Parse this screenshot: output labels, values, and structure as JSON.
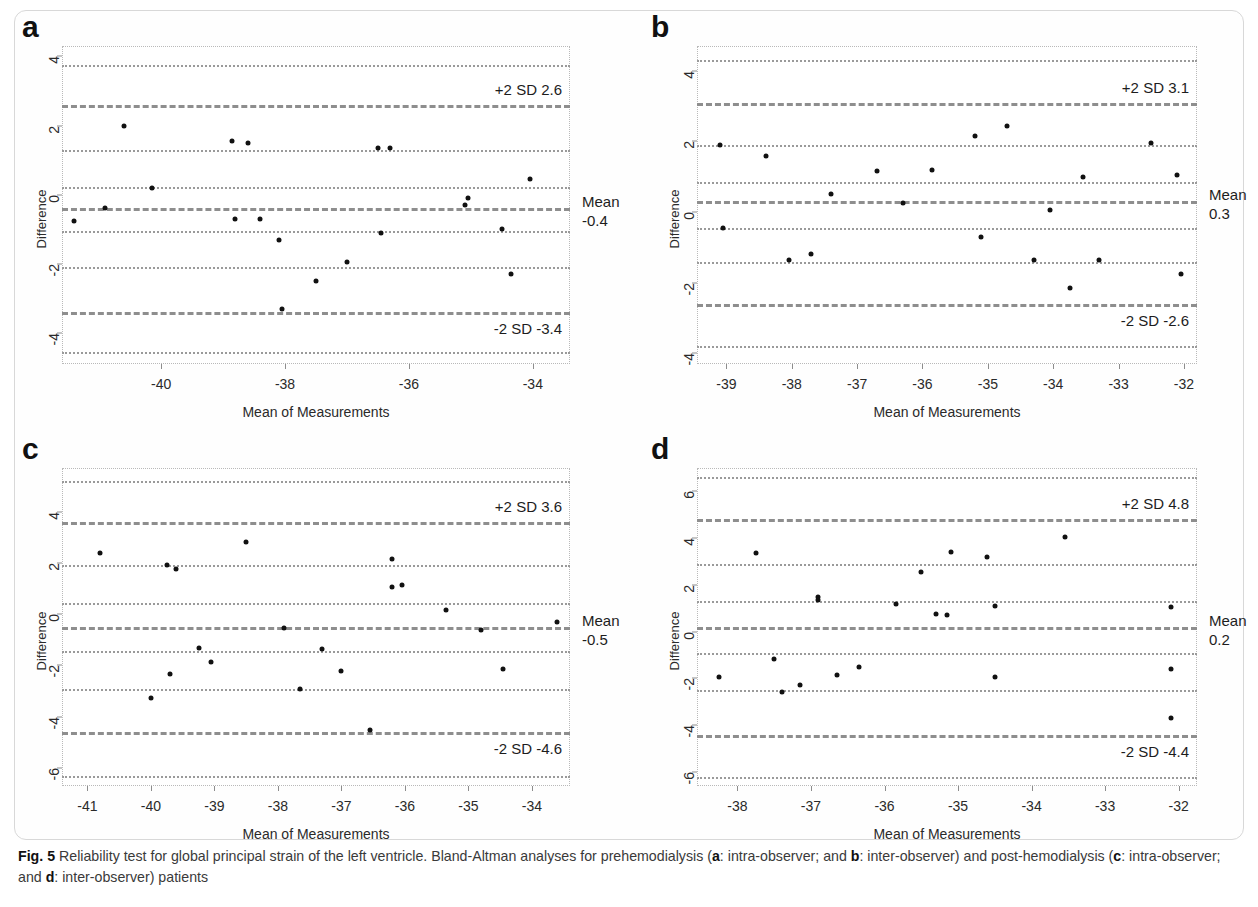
{
  "figure": {
    "label": "Fig. 5",
    "caption_part1": "Reliability test for global principal strain of the left ventricle. Bland-Altman analyses for prehemodialysis (",
    "caption_a": "a",
    "caption_part2": ": intra-observer; and ",
    "caption_b": "b",
    "caption_part3": ": inter-observer) and post-hemodialysis (",
    "caption_c": "c",
    "caption_part4": ": intra-observer; and ",
    "caption_d": "d",
    "caption_part5": ": inter-observer) patients"
  },
  "panels": {
    "a": {
      "letter": "a",
      "xlabel": "Mean of Measurements",
      "ylabel": "Difference",
      "upper_annotation": "+2 SD 2.6",
      "lower_annotation": "-2 SD -3.4",
      "mean_label_line1": "Mean",
      "mean_label_line2": "-0.4"
    },
    "b": {
      "letter": "b",
      "xlabel": "Mean of Measurements",
      "ylabel": "Difference",
      "upper_annotation": "+2 SD 3.1",
      "lower_annotation": "-2 SD -2.6",
      "mean_label_line1": "Mean",
      "mean_label_line2": "0.3"
    },
    "c": {
      "letter": "c",
      "xlabel": "Mean of Measurements",
      "ylabel": "Difference",
      "upper_annotation": "+2 SD 3.6",
      "lower_annotation": "-2 SD -4.6",
      "mean_label_line1": "Mean",
      "mean_label_line2": "-0.5"
    },
    "d": {
      "letter": "d",
      "xlabel": "Mean of Measurements",
      "ylabel": "Difference",
      "upper_annotation": "+2 SD 4.8",
      "lower_annotation": "-2 SD -4.4",
      "mean_label_line1": "Mean",
      "mean_label_line2": "0.2"
    }
  },
  "chart_data": [
    {
      "id": "a",
      "type": "scatter",
      "title": "a: intra-observer, prehemodialysis",
      "xlabel": "Mean of Measurements",
      "ylabel": "Difference",
      "xlim": [
        -41.6,
        -33.4
      ],
      "ylim": [
        -4.9,
        4.3
      ],
      "xticks": [
        -40,
        -38,
        -36,
        -34
      ],
      "yticks": [
        4,
        2,
        0,
        -2,
        -4
      ],
      "grid": true,
      "mean": -0.4,
      "upper_limit": 2.6,
      "lower_limit": -3.4,
      "extra_gridlines": [
        3.75,
        1.3,
        0.22,
        -1.05,
        -2.1,
        -4.55
      ],
      "points": [
        {
          "x": -41.4,
          "y": -0.75
        },
        {
          "x": -40.9,
          "y": -0.4
        },
        {
          "x": -40.6,
          "y": 2.0
        },
        {
          "x": -40.15,
          "y": 0.2
        },
        {
          "x": -38.85,
          "y": 1.55
        },
        {
          "x": -38.8,
          "y": -0.7
        },
        {
          "x": -38.6,
          "y": 1.5
        },
        {
          "x": -38.4,
          "y": -0.7
        },
        {
          "x": -38.1,
          "y": -1.3
        },
        {
          "x": -38.05,
          "y": -3.3
        },
        {
          "x": -37.5,
          "y": -2.5
        },
        {
          "x": -37.0,
          "y": -1.95
        },
        {
          "x": -36.5,
          "y": 1.35
        },
        {
          "x": -36.45,
          "y": -1.1
        },
        {
          "x": -36.3,
          "y": 1.35
        },
        {
          "x": -35.1,
          "y": -0.3
        },
        {
          "x": -35.05,
          "y": -0.1
        },
        {
          "x": -34.5,
          "y": -1.0
        },
        {
          "x": -34.35,
          "y": -2.3
        },
        {
          "x": -34.05,
          "y": 0.45
        }
      ]
    },
    {
      "id": "b",
      "type": "scatter",
      "title": "b: inter-observer, prehemodialysis",
      "xlabel": "Mean of Measurements",
      "ylabel": "Difference",
      "xlim": [
        -39.45,
        -31.8
      ],
      "ylim": [
        -4.3,
        4.7
      ],
      "xticks": [
        -39,
        -38,
        -37,
        -36,
        -35,
        -34,
        -33,
        -32
      ],
      "yticks": [
        4,
        2,
        0,
        -2,
        -4
      ],
      "grid": true,
      "mean": 0.3,
      "upper_limit": 3.1,
      "lower_limit": -2.6,
      "extra_gridlines": [
        4.3,
        1.9,
        0.85,
        -0.45,
        -1.4,
        -3.8
      ],
      "points": [
        {
          "x": -39.1,
          "y": 1.9
        },
        {
          "x": -39.05,
          "y": -0.45
        },
        {
          "x": -38.4,
          "y": 1.6
        },
        {
          "x": -38.05,
          "y": -1.35
        },
        {
          "x": -37.7,
          "y": -1.2
        },
        {
          "x": -37.4,
          "y": 0.5
        },
        {
          "x": -36.7,
          "y": 1.15
        },
        {
          "x": -36.3,
          "y": 0.25
        },
        {
          "x": -35.85,
          "y": 1.2
        },
        {
          "x": -35.2,
          "y": 2.15
        },
        {
          "x": -35.1,
          "y": -0.7
        },
        {
          "x": -34.7,
          "y": 2.45
        },
        {
          "x": -34.3,
          "y": -1.35
        },
        {
          "x": -34.05,
          "y": 0.05
        },
        {
          "x": -33.75,
          "y": -2.15
        },
        {
          "x": -33.55,
          "y": 1.0
        },
        {
          "x": -33.3,
          "y": -1.35
        },
        {
          "x": -32.5,
          "y": 1.95
        },
        {
          "x": -32.1,
          "y": 1.05
        },
        {
          "x": -32.05,
          "y": -1.75
        }
      ]
    },
    {
      "id": "c",
      "type": "scatter",
      "title": "c: intra-observer, post-hemodialysis",
      "xlabel": "Mean of Measurements",
      "ylabel": "Difference",
      "xlim": [
        -41.4,
        -33.4
      ],
      "ylim": [
        -6.7,
        5.7
      ],
      "xticks": [
        -41,
        -40,
        -39,
        -38,
        -37,
        -36,
        -35,
        -34
      ],
      "yticks": [
        4,
        2,
        0,
        -2,
        -4,
        -6
      ],
      "grid": true,
      "mean": -0.5,
      "upper_limit": 3.6,
      "lower_limit": -4.6,
      "extra_gridlines": [
        5.2,
        1.9,
        0.45,
        -1.45,
        -2.9,
        -6.3
      ],
      "points": [
        {
          "x": -40.8,
          "y": 2.4
        },
        {
          "x": -40.0,
          "y": -3.25
        },
        {
          "x": -39.75,
          "y": 1.9
        },
        {
          "x": -39.7,
          "y": -2.35
        },
        {
          "x": -39.6,
          "y": 1.75
        },
        {
          "x": -39.25,
          "y": -1.3
        },
        {
          "x": -39.05,
          "y": -1.85
        },
        {
          "x": -38.5,
          "y": 2.8
        },
        {
          "x": -37.9,
          "y": -0.55
        },
        {
          "x": -37.65,
          "y": -2.9
        },
        {
          "x": -37.3,
          "y": -1.35
        },
        {
          "x": -37.0,
          "y": -2.2
        },
        {
          "x": -36.55,
          "y": -4.5
        },
        {
          "x": -36.2,
          "y": 2.15
        },
        {
          "x": -36.2,
          "y": 1.05
        },
        {
          "x": -36.05,
          "y": 1.15
        },
        {
          "x": -35.35,
          "y": 0.15
        },
        {
          "x": -34.8,
          "y": -0.6
        },
        {
          "x": -34.45,
          "y": -2.15
        },
        {
          "x": -33.6,
          "y": -0.3
        }
      ]
    },
    {
      "id": "d",
      "type": "scatter",
      "title": "d: inter-observer, post-hemodialysis",
      "xlabel": "Mean of Measurements",
      "ylabel": "Difference",
      "xlim": [
        -38.55,
        -31.75
      ],
      "ylim": [
        -6.6,
        7.0
      ],
      "xticks": [
        -38,
        -37,
        -36,
        -35,
        -34,
        -33,
        -32
      ],
      "yticks": [
        6,
        4,
        2,
        0,
        -2,
        -4,
        -6
      ],
      "grid": true,
      "mean": 0.2,
      "upper_limit": 4.8,
      "lower_limit": -4.4,
      "extra_gridlines": [
        6.6,
        2.9,
        1.3,
        -0.9,
        -2.5,
        -6.2
      ],
      "points": [
        {
          "x": -38.25,
          "y": -1.95
        },
        {
          "x": -37.75,
          "y": 3.35
        },
        {
          "x": -37.5,
          "y": -1.15
        },
        {
          "x": -37.4,
          "y": -2.6
        },
        {
          "x": -37.15,
          "y": -2.3
        },
        {
          "x": -36.9,
          "y": 1.5
        },
        {
          "x": -36.9,
          "y": 1.35
        },
        {
          "x": -36.65,
          "y": -1.85
        },
        {
          "x": -36.35,
          "y": -1.5
        },
        {
          "x": -35.85,
          "y": 1.2
        },
        {
          "x": -35.5,
          "y": 2.55
        },
        {
          "x": -35.3,
          "y": 0.75
        },
        {
          "x": -35.15,
          "y": 0.7
        },
        {
          "x": -35.1,
          "y": 3.4
        },
        {
          "x": -34.6,
          "y": 3.2
        },
        {
          "x": -34.5,
          "y": 1.1
        },
        {
          "x": -34.5,
          "y": -1.95
        },
        {
          "x": -33.55,
          "y": 4.05
        },
        {
          "x": -32.1,
          "y": 1.05
        },
        {
          "x": -32.1,
          "y": -1.6
        },
        {
          "x": -32.1,
          "y": -3.7
        }
      ]
    }
  ]
}
